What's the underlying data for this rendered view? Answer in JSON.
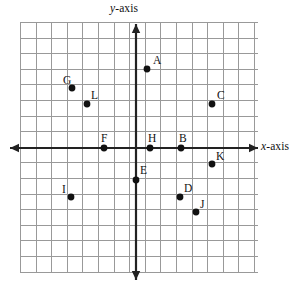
{
  "figure": {
    "type": "coordinate-plane",
    "title": "",
    "background_color": "#ffffff",
    "grid": {
      "visible": true,
      "line_color": "#999999",
      "left_px": 20,
      "top_px": 22,
      "right_px": 258,
      "bottom_px": 272,
      "cell_size_px": 15.6,
      "columns": 15,
      "rows": 16
    },
    "axes": {
      "color": "#222222",
      "origin_px": {
        "x": 136,
        "y": 148
      },
      "x_axis": {
        "label": "x-axis",
        "label_var": "x",
        "label_rest": "-axis",
        "arrow_left": true,
        "arrow_right": true,
        "start_px": 10,
        "end_px": 258
      },
      "y_axis": {
        "label": "y-axis",
        "label_var": "y",
        "label_rest": "-axis",
        "arrow_up": true,
        "arrow_down": true,
        "start_px": 24,
        "end_px": 280
      }
    },
    "point_style": {
      "fill": "#111111",
      "radius_px": 3.4
    },
    "points": [
      {
        "label": "A",
        "px": 147,
        "py": 69,
        "grid": [
          0.7,
          5.1
        ],
        "label_dx": 6,
        "label_dy": -14
      },
      {
        "label": "B",
        "px": 181,
        "py": 148,
        "grid": [
          2.9,
          0
        ],
        "label_dx": -2,
        "label_dy": -15
      },
      {
        "label": "C",
        "px": 212,
        "py": 104,
        "grid": [
          4.9,
          2.8
        ],
        "label_dx": 5,
        "label_dy": -14
      },
      {
        "label": "D",
        "px": 180,
        "py": 197,
        "grid": [
          2.8,
          -3.1
        ],
        "label_dx": 4,
        "label_dy": -14
      },
      {
        "label": "E",
        "px": 136,
        "py": 180,
        "grid": [
          0,
          -2.1
        ],
        "label_dx": 4,
        "label_dy": -15
      },
      {
        "label": "F",
        "px": 104,
        "py": 148,
        "grid": [
          -2.1,
          0
        ],
        "label_dx": -3,
        "label_dy": -15
      },
      {
        "label": "G",
        "px": 72,
        "py": 88,
        "grid": [
          -4.1,
          3.9
        ],
        "label_dx": -9,
        "label_dy": -13
      },
      {
        "label": "H",
        "px": 150,
        "py": 148,
        "grid": [
          0.9,
          0
        ],
        "label_dx": -2,
        "label_dy": -15
      },
      {
        "label": "I",
        "px": 71,
        "py": 197,
        "grid": [
          -4.2,
          -3.1
        ],
        "label_dx": -9,
        "label_dy": -13
      },
      {
        "label": "J",
        "px": 196,
        "py": 212,
        "grid": [
          3.8,
          -4.1
        ],
        "label_dx": 4,
        "label_dy": -13
      },
      {
        "label": "K",
        "px": 212,
        "py": 164,
        "grid": [
          4.9,
          -1
        ],
        "label_dx": 4,
        "label_dy": -13
      },
      {
        "label": "L",
        "px": 87,
        "py": 104,
        "grid": [
          -3.1,
          2.8
        ],
        "label_dx": 4,
        "label_dy": -14
      }
    ]
  }
}
